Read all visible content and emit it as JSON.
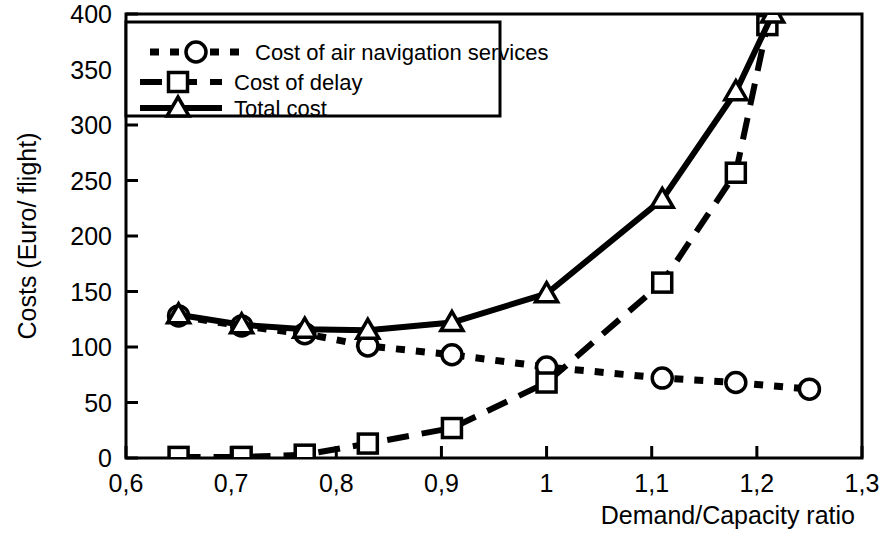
{
  "chart_data": {
    "type": "line",
    "title": "",
    "subtitle": "",
    "xlabel": "Demand/Capacity ratio",
    "ylabel": "Costs (Euro/ flight)",
    "xlim": [
      0.6,
      1.3
    ],
    "ylim": [
      0,
      400
    ],
    "xticks": [
      0.6,
      0.7,
      0.8,
      0.9,
      1.0,
      1.1,
      1.2,
      1.3
    ],
    "xtick_labels": [
      "0,6",
      "0,7",
      "0,8",
      "0,9",
      "1",
      "1,1",
      "1,2",
      "1,3"
    ],
    "yticks": [
      0,
      50,
      100,
      150,
      200,
      250,
      300,
      350,
      400
    ],
    "ytick_labels": [
      "0",
      "50",
      "100",
      "150",
      "200",
      "250",
      "300",
      "350",
      "400"
    ],
    "grid": false,
    "legend_position": "top-left",
    "decimal_separator": ",",
    "series": [
      {
        "name": "Cost of air navigation services",
        "marker": "circle",
        "line_style": "dotted",
        "color": "#000000",
        "x": [
          0.65,
          0.71,
          0.77,
          0.83,
          0.91,
          1.0,
          1.11,
          1.18,
          1.25
        ],
        "values": [
          128,
          119,
          112,
          101,
          93,
          82,
          72,
          68,
          62
        ]
      },
      {
        "name": "Cost of delay",
        "marker": "square",
        "line_style": "dashed",
        "color": "#000000",
        "x": [
          0.65,
          0.71,
          0.77,
          0.83,
          0.91,
          1.0,
          1.11,
          1.18,
          1.21
        ],
        "values": [
          1,
          1,
          3,
          13,
          27,
          68,
          158,
          257,
          390
        ]
      },
      {
        "name": "Total cost",
        "marker": "triangle",
        "line_style": "solid",
        "color": "#000000",
        "x": [
          0.65,
          0.71,
          0.77,
          0.83,
          0.91,
          1.0,
          1.11,
          1.18,
          1.215
        ],
        "values": [
          129,
          120,
          116,
          115,
          122,
          148,
          233,
          330,
          400
        ]
      }
    ]
  },
  "legend": {
    "items": [
      {
        "label": "Cost of air navigation services",
        "marker": "circle-marker",
        "style": "dotted"
      },
      {
        "label": "Cost of delay",
        "marker": "square-marker",
        "style": "dashed"
      },
      {
        "label": "Total cost",
        "marker": "triangle-marker",
        "style": "solid"
      }
    ]
  },
  "axes": {
    "x_title": "Demand/Capacity ratio",
    "y_title": "Costs (Euro/ flight)"
  }
}
